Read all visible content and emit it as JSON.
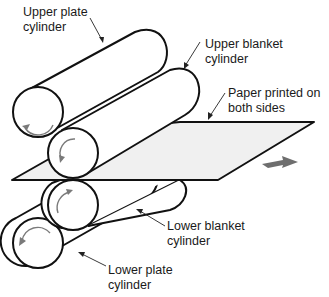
{
  "diagram": {
    "colors": {
      "outline": "#111111",
      "paper_fill": "#f0f0f0",
      "rotation_arrow": "#7a7a7a",
      "direction_arrow": "#6e6e6e",
      "background": "#ffffff"
    },
    "labels": {
      "upper_plate": {
        "line1": "Upper plate",
        "line2": "cylinder"
      },
      "upper_blanket": {
        "line1": "Upper blanket",
        "line2": "cylinder"
      },
      "paper": {
        "line1": "Paper printed on",
        "line2": "both sides"
      },
      "lower_blanket": {
        "line1": "Lower blanket",
        "line2": "cylinder"
      },
      "lower_plate": {
        "line1": "Lower plate",
        "line2": "cylinder"
      }
    },
    "components": [
      {
        "name": "Upper plate cylinder",
        "rotation": "counterclockwise"
      },
      {
        "name": "Upper blanket cylinder",
        "rotation": "counterclockwise"
      },
      {
        "name": "Lower blanket cylinder",
        "rotation": "clockwise"
      },
      {
        "name": "Lower plate cylinder",
        "rotation": "counterclockwise"
      },
      {
        "name": "Paper sheet",
        "direction": "right"
      }
    ]
  }
}
